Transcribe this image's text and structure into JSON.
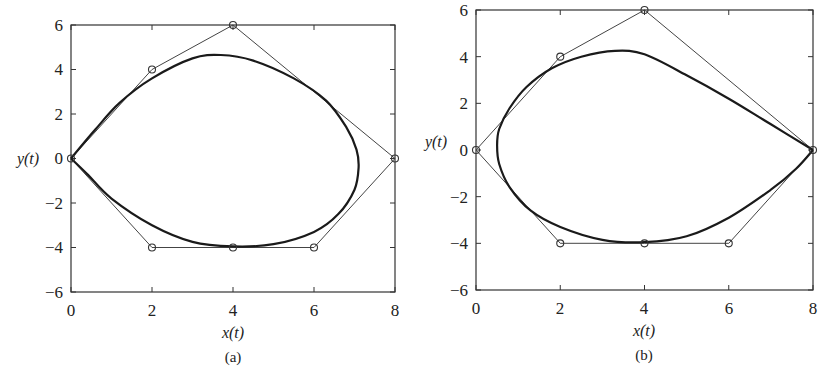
{
  "chart_data": [
    {
      "type": "line",
      "panel": "a",
      "caption": "(a)",
      "xlabel": "x(t)",
      "ylabel": "y(t)",
      "xlim": [
        0,
        8
      ],
      "ylim": [
        -6,
        6
      ],
      "xticks": [
        0,
        2,
        4,
        6,
        8
      ],
      "yticks": [
        -6,
        -4,
        -2,
        0,
        2,
        4,
        6
      ],
      "grid": false,
      "series": [
        {
          "name": "control polygon",
          "style": "thin line with circle markers",
          "x": [
            0,
            2,
            4,
            8,
            6,
            4,
            2,
            0
          ],
          "y": [
            0,
            4,
            6,
            0,
            -4,
            -4,
            -4,
            0
          ]
        },
        {
          "name": "closed curve",
          "style": "thick line",
          "x": [
            0,
            0.6,
            1.2,
            2.0,
            3.0,
            3.7,
            4.5,
            5.5,
            6.3,
            6.8,
            7.05,
            7.1,
            7.0,
            6.6,
            6.0,
            5.0,
            4.0,
            3.0,
            2.0,
            1.0,
            0.4,
            0
          ],
          "y": [
            0,
            1.3,
            2.5,
            3.6,
            4.5,
            4.65,
            4.4,
            3.6,
            2.6,
            1.4,
            0.4,
            -0.4,
            -1.4,
            -2.5,
            -3.3,
            -3.85,
            -3.95,
            -3.75,
            -3.0,
            -1.8,
            -0.7,
            0
          ]
        }
      ]
    },
    {
      "type": "line",
      "panel": "b",
      "caption": "(b)",
      "xlabel": "x(t)",
      "ylabel": "y(t)",
      "xlim": [
        0,
        8
      ],
      "ylim": [
        -6,
        6
      ],
      "xticks": [
        0,
        2,
        4,
        6,
        8
      ],
      "yticks": [
        -6,
        -4,
        -2,
        0,
        2,
        4,
        6
      ],
      "grid": false,
      "series": [
        {
          "name": "control polygon",
          "style": "thin line with circle markers",
          "x": [
            0,
            2,
            4,
            8,
            6,
            4,
            2,
            0
          ],
          "y": [
            0,
            4,
            6,
            0,
            -4,
            -4,
            -4,
            0
          ]
        },
        {
          "name": "closed curve",
          "style": "thick line",
          "x": [
            8,
            7.0,
            6.0,
            5.0,
            4.0,
            3.3,
            2.5,
            1.8,
            1.2,
            0.8,
            0.55,
            0.5,
            0.55,
            0.8,
            1.3,
            2.0,
            3.0,
            4.0,
            5.0,
            6.0,
            7.0,
            7.6,
            8
          ],
          "y": [
            0,
            1.1,
            2.2,
            3.2,
            4.1,
            4.25,
            4.0,
            3.5,
            2.7,
            1.8,
            0.9,
            0.2,
            -0.6,
            -1.6,
            -2.6,
            -3.3,
            -3.85,
            -3.95,
            -3.7,
            -2.9,
            -1.7,
            -0.8,
            0
          ]
        }
      ]
    }
  ],
  "panels": [
    {
      "caption": "(a)",
      "xlabel": "x(t)",
      "ylabel": "y(t)",
      "xtick_labels": [
        "0",
        "2",
        "4",
        "6",
        "8"
      ],
      "ytick_labels": [
        "6",
        "4",
        "2",
        "0",
        "−2",
        "−4",
        "−6"
      ]
    },
    {
      "caption": "(b)",
      "xlabel": "x(t)",
      "ylabel": "y(t)",
      "xtick_labels": [
        "0",
        "2",
        "4",
        "6",
        "8"
      ],
      "ytick_labels": [
        "6",
        "4",
        "2",
        "0",
        "−2",
        "−4",
        "−6"
      ]
    }
  ],
  "colors": {
    "curve": "#1a1a1a",
    "polygon": "#444444",
    "frame": "#333333",
    "background": "#ffffff"
  }
}
